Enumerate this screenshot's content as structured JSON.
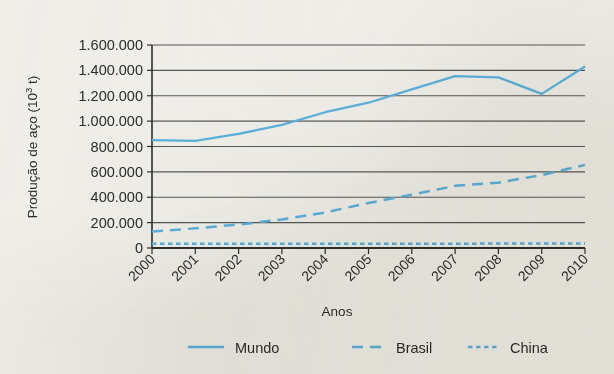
{
  "chart_data": {
    "type": "line",
    "title": "",
    "xlabel": "Anos",
    "ylabel": "Produção de aço (10³ t)",
    "ylabel_base": "Produção de aço (10",
    "ylabel_exp": "3",
    "ylabel_tail": " t)",
    "categories": [
      "2000",
      "2001",
      "2002",
      "2003",
      "2004",
      "2005",
      "2006",
      "2007",
      "2008",
      "2009",
      "2010"
    ],
    "x": [
      2000,
      2001,
      2002,
      2003,
      2004,
      2005,
      2006,
      2007,
      2008,
      2009,
      2010
    ],
    "ylim": [
      0,
      1600000
    ],
    "xlim": [
      2000,
      2010
    ],
    "ytick_labels": [
      "1.600.000",
      "1.400.000",
      "1.200.000",
      "1.000.000",
      "800.000",
      "600.000",
      "400.000",
      "200.000",
      "0"
    ],
    "ytick_values": [
      1600000,
      1400000,
      1200000,
      1000000,
      800000,
      600000,
      400000,
      200000,
      0
    ],
    "grid": true,
    "grid_axis": "y",
    "legend_position": "bottom",
    "series": [
      {
        "name": "Mundo",
        "style": "solid",
        "color": "#5cb3e0",
        "values": [
          850000,
          845000,
          900000,
          970000,
          1070000,
          1145000,
          1250000,
          1355000,
          1345000,
          1215000,
          1430000
        ]
      },
      {
        "name": "Brasil",
        "style": "dashed",
        "color": "#5cb3e0",
        "values": [
          130000,
          155000,
          185000,
          225000,
          280000,
          355000,
          420000,
          490000,
          515000,
          575000,
          655000
        ]
      },
      {
        "name": "China",
        "style": "dotted",
        "color": "#5cb3e0",
        "values": [
          33000,
          33000,
          33000,
          33000,
          33000,
          34000,
          34000,
          34000,
          35000,
          35000,
          36000
        ]
      }
    ]
  },
  "colors": {
    "series": "#5cb3e0",
    "grid": "#585858",
    "axis": "#2f2f2f",
    "text": "#2c2c2c",
    "paper": "#f2f1ed"
  }
}
